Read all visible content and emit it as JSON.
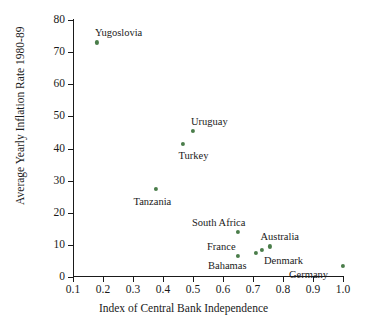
{
  "chart_data": {
    "type": "scatter",
    "title": "",
    "xlabel": "Index of Central Bank Independence",
    "ylabel": "Average Yearly Inflation Rate 1980-89",
    "xlim": [
      0.05,
      1.05
    ],
    "ylim": [
      0,
      80
    ],
    "grid": false,
    "legend": null,
    "xticks": [
      "0.1",
      "0.2",
      "0.3",
      "0.4",
      "0.5",
      "0.6",
      "0.7",
      "0.8",
      "0.9",
      "1.0"
    ],
    "xtick_values": [
      0.1,
      0.2,
      0.3,
      0.4,
      0.5,
      0.6,
      0.7,
      0.8,
      0.9,
      1.0
    ],
    "yticks": [
      "0",
      "10",
      "20",
      "30",
      "40",
      "50",
      "60",
      "70",
      "80"
    ],
    "ytick_values": [
      0,
      10,
      20,
      30,
      40,
      50,
      60,
      70,
      80
    ],
    "marker_color": "#4a7d4a",
    "points": [
      {
        "name": "Yugoslovia",
        "x": 0.18,
        "y": 73.0,
        "label": "Yugoslovia",
        "label_dx": -2,
        "label_dy": -14
      },
      {
        "name": "Uruguay",
        "x": 0.5,
        "y": 45.5,
        "label": "Uruguay",
        "label_dx": -2,
        "label_dy": -14
      },
      {
        "name": "Turkey",
        "x": 0.465,
        "y": 41.5,
        "label": "Turkey",
        "label_dx": -4,
        "label_dy": 7
      },
      {
        "name": "Tanzania",
        "x": 0.375,
        "y": 27.5,
        "label": "Tanzania",
        "label_dx": -22,
        "label_dy": 8
      },
      {
        "name": "South Africa",
        "x": 0.65,
        "y": 14.0,
        "label": "South Africa",
        "label_dx": -46,
        "label_dy": -14
      },
      {
        "name": "France",
        "x": 0.65,
        "y": 6.5,
        "label": "France",
        "label_dx": -31,
        "label_dy": -14
      },
      {
        "name": "Bahamas",
        "x": 0.71,
        "y": 7.5,
        "label": "Bahamas",
        "label_dx": -48,
        "label_dy": 8
      },
      {
        "name": "Denmark",
        "x": 0.73,
        "y": 8.5,
        "label": "Denmark",
        "label_dx": 2,
        "label_dy": 6
      },
      {
        "name": "Australia",
        "x": 0.755,
        "y": 9.5,
        "label": "Australia",
        "label_dx": -9,
        "label_dy": -14
      },
      {
        "name": "Germany",
        "x": 1.0,
        "y": 3.5,
        "label": "Germany",
        "label_dx": -54,
        "label_dy": 4
      }
    ]
  }
}
